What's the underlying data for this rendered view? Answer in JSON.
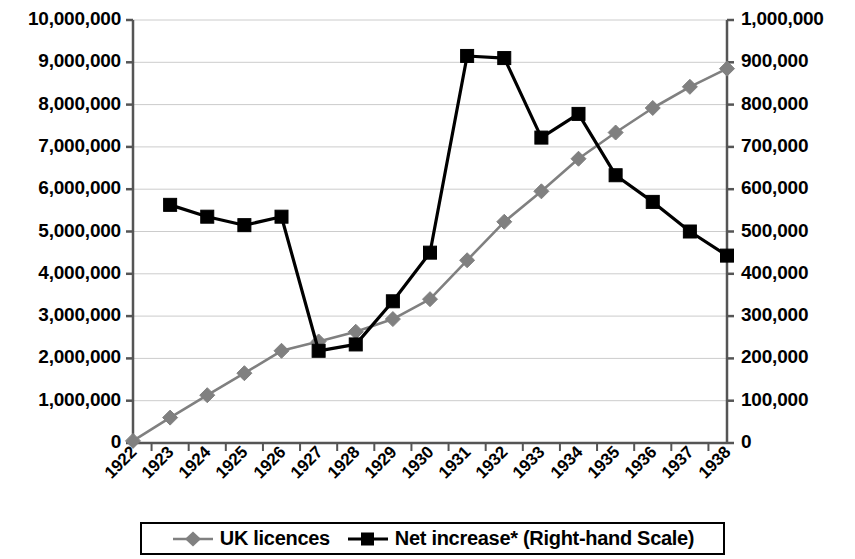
{
  "chart_data": {
    "type": "line",
    "title": "",
    "subtitle": "",
    "xlabel": "",
    "ylabel": "",
    "y2label": "",
    "grid": true,
    "legend_position": "bottom",
    "categories": [
      "1922",
      "1923",
      "1924",
      "1925",
      "1926",
      "1927",
      "1928",
      "1929",
      "1930",
      "1931",
      "1932",
      "1933",
      "1934",
      "1935",
      "1936",
      "1937",
      "1938"
    ],
    "y_left_ticks": [
      "0",
      "1,000,000",
      "2,000,000",
      "3,000,000",
      "4,000,000",
      "5,000,000",
      "6,000,000",
      "7,000,000",
      "8,000,000",
      "9,000,000",
      "10,000,000"
    ],
    "y_right_ticks": [
      "0",
      "100,000",
      "200,000",
      "300,000",
      "400,000",
      "500,000",
      "600,000",
      "700,000",
      "800,000",
      "900,000",
      "1,000,000"
    ],
    "ylim": [
      0,
      10000000
    ],
    "y2lim": [
      0,
      1000000
    ],
    "series": [
      {
        "name": "UK licences",
        "axis": "left",
        "color": "#808080",
        "marker": "diamond",
        "x": [
          "1922",
          "1923",
          "1924",
          "1925",
          "1926",
          "1927",
          "1928",
          "1929",
          "1930",
          "1931",
          "1932",
          "1933",
          "1934",
          "1935",
          "1936",
          "1937",
          "1938"
        ],
        "values": [
          50000,
          600000,
          1130000,
          1650000,
          2180000,
          2400000,
          2630000,
          2930000,
          3400000,
          4320000,
          5230000,
          5950000,
          6720000,
          7340000,
          7920000,
          8420000,
          8850000
        ]
      },
      {
        "name": "Net increase* (Right-hand Scale)",
        "axis": "right",
        "color": "#000000",
        "marker": "square",
        "x": [
          "1923",
          "1924",
          "1925",
          "1926",
          "1927",
          "1928",
          "1929",
          "1930",
          "1931",
          "1932",
          "1933",
          "1934",
          "1935",
          "1936",
          "1937",
          "1938"
        ],
        "values": [
          563000,
          535000,
          515000,
          535000,
          218000,
          233000,
          335000,
          450000,
          915000,
          910000,
          722000,
          778000,
          633000,
          570000,
          500000,
          443000
        ]
      }
    ]
  },
  "legend": {
    "entries": [
      {
        "label": "UK licences",
        "marker": "diamond-marker-icon",
        "color": "#808080"
      },
      {
        "label": "Net increase* (Right-hand Scale)",
        "marker": "square-marker-icon",
        "color": "#000000"
      }
    ]
  },
  "colors": {
    "uk_licences": "#808080",
    "net_increase": "#000000",
    "gridline": "#cccccc",
    "axis": "#555555",
    "background": "#ffffff"
  }
}
